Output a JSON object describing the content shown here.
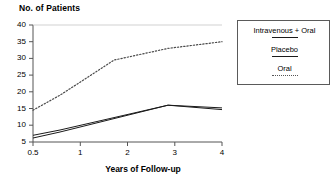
{
  "chart_data": {
    "type": "line",
    "title": "No. of Patients",
    "xlabel": "Years of Follow-up",
    "ylabel": "No. of Patients",
    "x": [
      0.5,
      1,
      2,
      3,
      4
    ],
    "xlim": [
      0.5,
      4
    ],
    "ylim": [
      5,
      40
    ],
    "xticks": [
      "0.5",
      "1",
      "2",
      "3",
      "4"
    ],
    "yticks": [
      "5",
      "10",
      "15",
      "20",
      "25",
      "30",
      "35",
      "40"
    ],
    "grid": false,
    "legend_position": "top-right",
    "series": [
      {
        "name": "Intravenous + Oral",
        "style": "solid",
        "values": [
          7.0,
          8.6,
          12.3,
          16.0,
          15.2
        ]
      },
      {
        "name": "Placebo",
        "style": "solid",
        "values": [
          6.2,
          8.0,
          12.0,
          16.0,
          14.7
        ]
      },
      {
        "name": "Oral",
        "style": "dotted",
        "values": [
          14.5,
          19.0,
          29.5,
          33.0,
          35.0
        ]
      }
    ]
  },
  "legend": {
    "items": [
      {
        "label": "Intravenous + Oral",
        "style": "solid"
      },
      {
        "label": "Placebo",
        "style": "solid"
      },
      {
        "label": "Oral",
        "style": "dotted"
      }
    ]
  }
}
